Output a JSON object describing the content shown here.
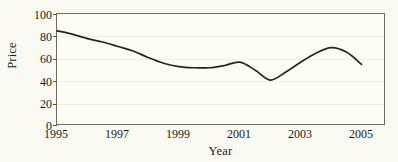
{
  "chart_data": {
    "type": "line",
    "title": "",
    "xlabel": "Year",
    "ylabel": "Price",
    "xlim": [
      1995,
      2005.8
    ],
    "ylim": [
      0,
      100
    ],
    "grid": true,
    "legend": false,
    "xticks": [
      1995,
      1997,
      1999,
      2001,
      2003,
      2005
    ],
    "xtick_labels": [
      "1995",
      "1997",
      "1999",
      "2001",
      "2003",
      "2005"
    ],
    "yticks": [
      0,
      20,
      40,
      60,
      80,
      100
    ],
    "ytick_labels": [
      "0",
      "20",
      "40",
      "60",
      "80",
      "100"
    ],
    "series": [
      {
        "name": "Price",
        "color": "#272720",
        "x": [
          1995,
          1995.5,
          1996,
          1996.5,
          1997,
          1997.5,
          1998,
          1998.5,
          1999,
          1999.5,
          2000,
          2000.5,
          2001,
          2001.5,
          2002,
          2002.5,
          2003,
          2003.5,
          2004,
          2004.5,
          2005
        ],
        "values": [
          85,
          82,
          78,
          75,
          71,
          67,
          61,
          56,
          53,
          52,
          52,
          54,
          57,
          50,
          41,
          48,
          57,
          65,
          70,
          66,
          55
        ]
      }
    ]
  },
  "axes": {
    "y_title": "Price",
    "x_title": "Year"
  }
}
